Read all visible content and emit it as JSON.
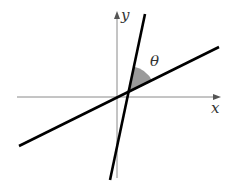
{
  "diagram": {
    "axes": {
      "x_label": "x",
      "y_label": "y",
      "color": "#8a8a8a"
    },
    "lines": [
      {
        "name": "shallow-line",
        "from": [
          19,
          146
        ],
        "to": [
          219,
          47
        ],
        "color": "#000000"
      },
      {
        "name": "steep-line",
        "from": [
          110,
          180
        ],
        "to": [
          145,
          14
        ],
        "color": "#000000"
      }
    ],
    "angle": {
      "label": "θ",
      "fill": "#9a9a9a",
      "vertex": [
        128,
        93
      ]
    }
  }
}
